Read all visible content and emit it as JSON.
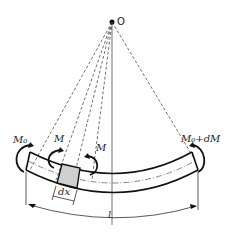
{
  "diagram": {
    "center_label": "O",
    "labels": {
      "left_moment": "M₀",
      "element_left_moment": "M",
      "element_right_moment": "M",
      "right_moment": "M₀+dM",
      "element_length": "dx",
      "beam_length": "l"
    },
    "colors": {
      "line": "#1a1a1a",
      "element_fill": "#cfcfcf",
      "background": "#ffffff"
    }
  }
}
